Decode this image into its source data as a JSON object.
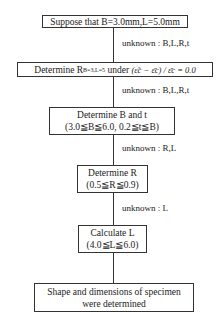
{
  "flowchart": {
    "steps": [
      {
        "line1": "Suppose that B=3.0mm,L=5.0mm"
      },
      {
        "prefix": "Determine R",
        "subscript": "B=3,L=5",
        "mid": " under ",
        "condition": "(ε̃c − ε̄c) / ε̄c = 0.0"
      },
      {
        "line1": "Determine B and t",
        "line2": "(3.0≦B≦6.0, 0.2≦t≦B)"
      },
      {
        "line1": "Determine R",
        "line2": "(0.5≦R≦0.9)"
      },
      {
        "line1": "Calculate L",
        "line2": "(4.0≦L≦6.0)"
      },
      {
        "line1": "Shape and dimensions of specimen",
        "line2": "were determined"
      }
    ],
    "connectors": [
      {
        "label": "unknown : B,L,R,t"
      },
      {
        "label": "unknown : B,L,R,t"
      },
      {
        "label": "unknown : R,L"
      },
      {
        "label": "unknown : L"
      },
      {
        "label": ""
      }
    ]
  }
}
